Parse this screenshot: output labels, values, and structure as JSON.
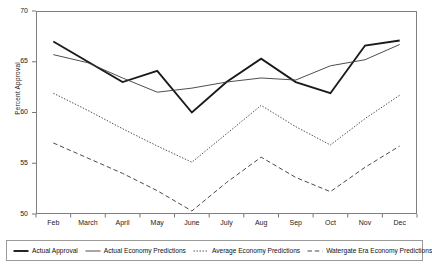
{
  "chart_data": {
    "type": "line",
    "title": "",
    "xlabel": "",
    "ylabel": "Percent Approval",
    "categories": [
      "Feb",
      "March",
      "April",
      "May",
      "June",
      "July",
      "Aug",
      "Sep",
      "Oct",
      "Nov",
      "Dec"
    ],
    "ylim": [
      50,
      70
    ],
    "yticks": [
      50,
      55,
      60,
      65,
      70
    ],
    "grid": false,
    "legend_position": "bottom",
    "series": [
      {
        "name": "Actual Approval",
        "style": "solid-thick",
        "color": "#1a1a1a",
        "values": [
          67.0,
          65.0,
          63.0,
          64.1,
          60.0,
          63.0,
          65.3,
          63.0,
          61.9,
          66.6,
          67.1
        ]
      },
      {
        "name": "Actual Economy Predictions",
        "style": "solid-thin",
        "color": "#3a3a3a",
        "values": [
          65.7,
          64.9,
          63.4,
          62.0,
          62.4,
          63.0,
          63.4,
          63.2,
          64.6,
          65.2,
          66.7
        ]
      },
      {
        "name": "Average Economy Predictions",
        "style": "dotted",
        "color": "#4a4a4a",
        "values": [
          61.9,
          60.2,
          58.4,
          56.7,
          55.1,
          57.9,
          60.7,
          58.6,
          56.8,
          59.4,
          61.7
        ]
      },
      {
        "name": "Watergate Era Economy Predictions",
        "style": "dashed",
        "color": "#4a4a4a",
        "values": [
          57.0,
          55.5,
          54.0,
          52.3,
          50.3,
          53.1,
          55.6,
          53.6,
          52.2,
          54.6,
          56.7
        ]
      }
    ]
  },
  "legend": {
    "items": [
      {
        "label": "Actual Approval",
        "icon": "solid-thick-line-swatch"
      },
      {
        "label": "Actual Economy Predictions",
        "icon": "solid-thin-line-swatch"
      },
      {
        "label": "Average Economy Predictions",
        "icon": "dotted-line-swatch"
      },
      {
        "label": "Watergate Era Economy Predictions",
        "icon": "dashed-line-swatch"
      }
    ]
  }
}
